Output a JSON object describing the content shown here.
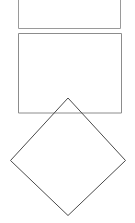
{
  "figure": {
    "canvas": {
      "width": 135,
      "height": 223,
      "background_color": "#ffffff"
    },
    "shapes": [
      {
        "id": "rectangle-top",
        "label": "Top rectangle (cropped at image top edge)",
        "type": "rectangle",
        "stroke_color": "#9a9a9a",
        "stroke_width": 1,
        "fill": "none",
        "x": 18.5,
        "y": -8,
        "width": 102,
        "height": 36.5,
        "points": "18.5,-8 120.5,-8 120.5,28.5 18.5,28.5"
      },
      {
        "id": "rectangle-middle",
        "label": "Middle rectangle",
        "type": "rectangle",
        "stroke_color": "#8c8c8c",
        "stroke_width": 1,
        "fill": "none",
        "x": 18.5,
        "y": 33.5,
        "width": 103,
        "height": 79.5,
        "points": "18.5,33.5 121.5,33.5 121.5,113 18.5,113"
      },
      {
        "id": "diamond-square",
        "label": "Rotated square (diamond)",
        "type": "polygon",
        "stroke_color": "#4a4a4a",
        "stroke_width": 1,
        "fill": "none",
        "vertices": {
          "top": [
            68,
            98
          ],
          "right": [
            125.5,
            160.5
          ],
          "bottom": [
            68,
            215.5
          ],
          "left": [
            10.5,
            160.5
          ]
        },
        "points": "68,98 125.5,160.5 68,215.5 10.5,160.5"
      }
    ]
  }
}
